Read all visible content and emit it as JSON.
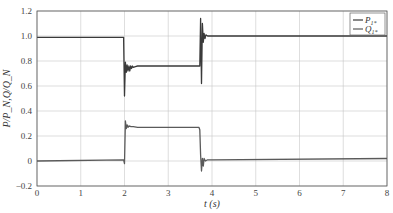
{
  "chart_data": {
    "type": "line",
    "title": "",
    "xlabel": "t (s)",
    "ylabel": "P/P_N,Q/Q_N",
    "xlim": [
      0,
      8
    ],
    "ylim": [
      -0.2,
      1.2
    ],
    "xticks": [
      0,
      1,
      2,
      3,
      4,
      5,
      6,
      7,
      8
    ],
    "xtick_labels": [
      "0",
      "1",
      "2",
      "3",
      "4",
      "5",
      "6",
      "7",
      "8"
    ],
    "yticks": [
      -0.2,
      0,
      0.2,
      0.4,
      0.6,
      0.8,
      1.0,
      1.2
    ],
    "ytick_labels": [
      "−0.2",
      "0",
      "0.2",
      "0.4",
      "0.6",
      "0.8",
      "1.0",
      "1.2"
    ],
    "grid": true,
    "legend_position": "upper right",
    "series": [
      {
        "name": "P1*",
        "label_main": "P",
        "label_sub": "1*",
        "color": "#3a3a3a",
        "x": [
          0,
          1.98,
          2.0,
          2.02,
          2.04,
          2.06,
          2.08,
          2.1,
          2.12,
          2.14,
          2.16,
          2.18,
          2.2,
          2.25,
          2.3,
          3.72,
          3.74,
          3.76,
          3.78,
          3.8,
          3.82,
          3.84,
          3.86,
          3.9,
          3.95,
          4.0,
          8.0
        ],
        "y": [
          0.99,
          0.99,
          0.52,
          0.79,
          0.71,
          0.77,
          0.72,
          0.76,
          0.72,
          0.76,
          0.74,
          0.76,
          0.75,
          0.755,
          0.76,
          0.76,
          1.14,
          0.62,
          1.1,
          0.95,
          1.02,
          0.98,
          1.01,
          1.0,
          1.0,
          1.0,
          1.0
        ]
      },
      {
        "name": "Q1*",
        "label_main": "Q",
        "label_sub": "1*",
        "color": "#5a5a5a",
        "x": [
          0,
          1.98,
          2.0,
          2.02,
          2.04,
          2.06,
          2.08,
          2.1,
          2.15,
          2.2,
          2.3,
          3.7,
          3.72,
          3.74,
          3.76,
          3.78,
          3.8,
          3.82,
          3.85,
          3.9,
          4.0,
          8.0
        ],
        "y": [
          0.0,
          0.01,
          -0.02,
          0.32,
          0.26,
          0.29,
          0.27,
          0.28,
          0.275,
          0.275,
          0.27,
          0.27,
          0.25,
          0.05,
          -0.08,
          0.02,
          -0.04,
          0.02,
          0.0,
          0.01,
          0.01,
          0.02
        ]
      }
    ]
  }
}
